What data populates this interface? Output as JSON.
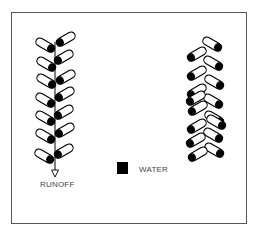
{
  "diagram": {
    "labels": {
      "runoff": "RUNOFF",
      "water": "WATER"
    },
    "legend": {
      "water_color": "#000000"
    },
    "colors": {
      "outline": "#000000",
      "frame": "#555555",
      "background": "#ffffff"
    },
    "left_plant": {
      "description": "stem with alternating leaves, water collected at leaf bases and flowing down stem as runoff",
      "leaf_count": 14
    },
    "right_plant": {
      "description": "leaves angled outward with water at outer leaf tips",
      "leaf_count": 16
    }
  }
}
